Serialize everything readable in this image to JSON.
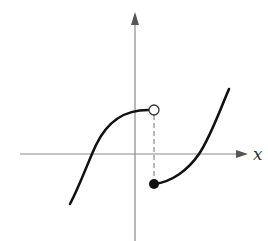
{
  "figure": {
    "x_axis_label": "x",
    "y_axis_label": "y",
    "colors": {
      "axis": "#8a8a8a",
      "curve": "#111111",
      "dashed_guide": "#777777",
      "open_point_fill": "#ffffff",
      "closed_point_fill": "#111111",
      "label": "#333333"
    },
    "annotations": {
      "open_point": "hollow circle at left-limit end of left branch",
      "closed_point": "filled dot at start of right branch",
      "dashed_line": "vertical dashed line connecting open and closed points"
    }
  }
}
